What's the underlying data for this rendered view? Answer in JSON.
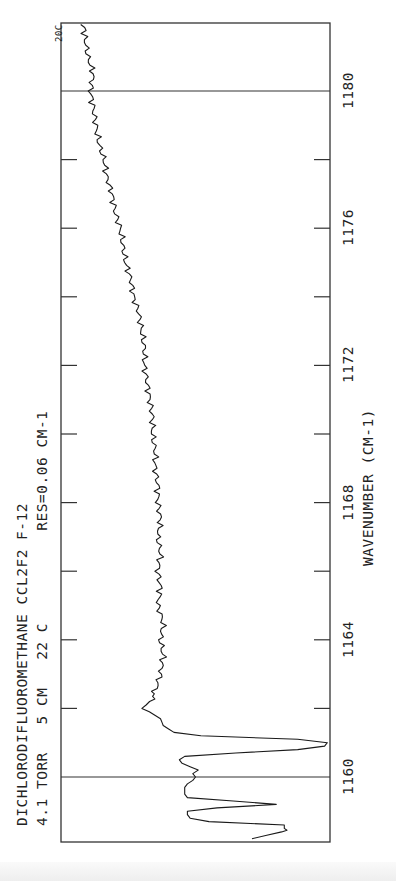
{
  "header": {
    "line1": "DICHLORODIFLUOROMETHANE   CCL2F2   F-12",
    "line2": "4.1 TORR   5 CM   22 C          RES=0.06 CM-1",
    "corner_label": "20C"
  },
  "axis": {
    "xlabel": "WAVENUMBER (CM-1)",
    "tick_labels": [
      "1160",
      "1164",
      "1168",
      "1172",
      "1176",
      "1180"
    ]
  },
  "chart_data": {
    "type": "line",
    "title": "DICHLORODIFLUOROMETHANE CCL2F2 F-12",
    "subtitle": "4.1 TORR 5 CM 22 C  RES=0.06 CM-1",
    "corner_annotation": "20C",
    "xlabel": "WAVENUMBER (CM-1)",
    "ylabel": "",
    "orientation": "rotated 90° counter-clockwise (wavenumber axis vertical, increasing upward)",
    "xlim": [
      1158.2,
      1182.2
    ],
    "x_ticks_major": [
      1160,
      1164,
      1168,
      1172,
      1176,
      1180
    ],
    "x_ticks_minor": [
      1161,
      1162,
      1163,
      1165,
      1166,
      1167,
      1169,
      1170,
      1171,
      1173,
      1174,
      1175,
      1177,
      1178,
      1179
    ],
    "reference_lines": [
      1160,
      1180
    ],
    "ylim": [
      0,
      100
    ],
    "grid": false,
    "series": [
      {
        "name": "spectrum",
        "note": "signal in % of frame width (0 = left edge, 100 = right edge); absorption features extend right",
        "x": [
          1158.2,
          1158.4,
          1158.45,
          1158.5,
          1158.6,
          1158.7,
          1158.8,
          1158.9,
          1159.0,
          1159.1,
          1159.2,
          1159.3,
          1159.4,
          1159.5,
          1159.6,
          1159.7,
          1159.8,
          1159.9,
          1160.0,
          1160.1,
          1160.2,
          1160.3,
          1160.4,
          1160.5,
          1160.6,
          1160.7,
          1160.8,
          1160.9,
          1161.0,
          1161.1,
          1161.2,
          1161.3,
          1161.5,
          1161.7,
          1161.9,
          1162.0,
          1162.2,
          1162.5,
          1163.0,
          1163.5,
          1164.0,
          1164.5,
          1165.0,
          1165.5,
          1166.0,
          1166.5,
          1167.0,
          1167.5,
          1168.0,
          1168.5,
          1169.0,
          1169.5,
          1170.0,
          1170.5,
          1171.0,
          1171.5,
          1172.0,
          1172.5,
          1173.0,
          1173.5,
          1174.0,
          1174.5,
          1175.0,
          1175.5,
          1176.0,
          1176.5,
          1177.0,
          1177.5,
          1178.0,
          1178.5,
          1179.0,
          1179.5,
          1180.0,
          1180.5,
          1181.0,
          1181.5,
          1182.2
        ],
        "y": [
          71,
          82,
          84,
          83,
          83,
          55,
          48,
          47,
          47,
          58,
          80,
          64,
          47,
          46,
          46,
          46,
          47,
          49,
          50,
          49,
          51,
          48,
          45,
          44,
          46,
          65,
          88,
          98,
          99,
          88,
          52,
          42,
          38,
          37,
          33,
          30,
          33,
          35,
          37,
          38,
          37,
          38,
          36,
          37,
          36,
          37,
          36,
          37,
          36,
          36,
          35,
          35,
          34,
          34,
          33,
          32,
          31,
          31,
          30,
          29,
          27,
          26,
          24,
          23,
          22,
          20,
          19,
          17,
          16,
          14,
          13,
          12,
          11,
          12,
          10,
          9,
          8
        ]
      }
    ]
  }
}
